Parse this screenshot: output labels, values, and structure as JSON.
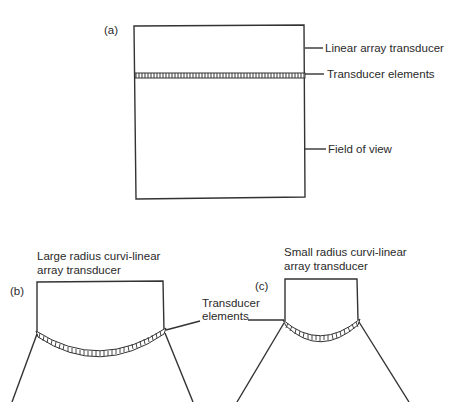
{
  "figure": {
    "panel_a": {
      "label": "(a)",
      "annotations": {
        "transducer": "Linear array transducer",
        "elements": "Transducer elements",
        "field": "Field of view"
      }
    },
    "panel_b": {
      "label": "(b)",
      "title_line1": "Large radius curvi-linear",
      "title_line2": "array transducer"
    },
    "panel_c": {
      "label": "(c)",
      "title_line1": "Small radius curvi-linear",
      "title_line2": "array transducer"
    },
    "shared_annotation": {
      "line1": "Transducer",
      "line2": "elements"
    }
  },
  "colors": {
    "line": "#333333",
    "text": "#2a2a2a",
    "background": "#ffffff"
  }
}
